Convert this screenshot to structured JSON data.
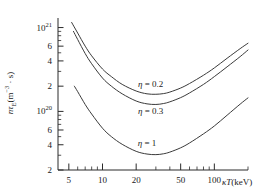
{
  "chart_data": {
    "type": "line",
    "title": "",
    "subtitle": "",
    "xlabel": "κT(keV)",
    "ylabel": "nτE(m⁻³ · s)",
    "xscale": "log",
    "yscale": "log",
    "xlim": [
      4,
      200
    ],
    "ylim": [
      2e+19,
      1.3e+21
    ],
    "grid": false,
    "legend_position": "inline-annotations",
    "xticks_major": [
      5,
      10,
      20,
      50,
      100
    ],
    "xtick_labels": [
      "5",
      "10",
      "20",
      "50",
      "100"
    ],
    "xticks_minor": [
      6,
      7,
      8,
      9,
      30,
      40,
      60,
      70,
      80,
      90,
      200
    ],
    "ytick_labels": [
      {
        "value": 1e+21,
        "text": "10",
        "exponent": "21"
      },
      {
        "value": 6e+20,
        "text": "6",
        "exponent": ""
      },
      {
        "value": 4e+20,
        "text": "4",
        "exponent": ""
      },
      {
        "value": 2e+20,
        "text": "2",
        "exponent": ""
      },
      {
        "value": 1e+20,
        "text": "10",
        "exponent": "20"
      },
      {
        "value": 6e+19,
        "text": "6",
        "exponent": ""
      },
      {
        "value": 4e+19,
        "text": "4",
        "exponent": ""
      },
      {
        "value": 2e+19,
        "text": "2",
        "exponent": ""
      }
    ],
    "yticks_minor": [
      9e+20,
      8e+20,
      7e+20,
      5e+20,
      3e+20,
      9e+19,
      8e+19,
      7e+19,
      5e+19,
      3e+19
    ],
    "series": [
      {
        "name": "η = 0.2",
        "annotation": "η = 0.2",
        "annotation_x": 27,
        "annotation_y": 2.1e+20,
        "color": "#3a3a3a",
        "x": [
          5.3,
          6,
          7,
          8,
          10,
          12,
          15,
          20,
          25,
          30,
          35,
          40,
          50,
          60,
          80,
          100,
          130,
          170,
          200
        ],
        "y": [
          1.15e+21,
          8.6e+20,
          6e+20,
          4.6e+20,
          3.2e+20,
          2.6e+20,
          2.1e+20,
          1.75e+20,
          1.62e+20,
          1.6e+20,
          1.63e+20,
          1.7e+20,
          1.9e+20,
          2.15e+20,
          2.7e+20,
          3.3e+20,
          4.3e+20,
          5.6e+20,
          6.5e+20
        ]
      },
      {
        "name": "η = 0.3",
        "annotation": "η = 0.3",
        "annotation_x": 27,
        "annotation_y": 1e+20,
        "color": "#3a3a3a",
        "x": [
          5.5,
          6,
          7,
          8,
          10,
          12,
          15,
          20,
          25,
          30,
          35,
          40,
          50,
          60,
          80,
          100,
          130,
          170,
          200
        ],
        "y": [
          9e+20,
          7.2e+20,
          4.9e+20,
          3.7e+20,
          2.5e+20,
          2e+20,
          1.62e+20,
          1.33e+20,
          1.23e+20,
          1.21e+20,
          1.24e+20,
          1.3e+20,
          1.46e+20,
          1.66e+20,
          2.1e+20,
          2.6e+20,
          3.4e+20,
          4.5e+20,
          5.4e+20
        ]
      },
      {
        "name": "η = 1",
        "annotation": "η = 1",
        "annotation_x": 25,
        "annotation_y": 4.2e+19,
        "color": "#3a3a3a",
        "x": [
          5.6,
          6,
          7,
          8,
          10,
          12,
          15,
          20,
          25,
          30,
          35,
          40,
          50,
          60,
          80,
          100,
          130,
          170,
          200
        ],
        "y": [
          2e+20,
          1.72e+20,
          1.21e+20,
          9.3e+19,
          6.3e+19,
          5e+19,
          4.05e+19,
          3.34e+19,
          3.1e+19,
          3.05e+19,
          3.12e+19,
          3.27e+19,
          3.68e+19,
          4.2e+19,
          5.4e+19,
          6.7e+19,
          9e+19,
          1.22e+20,
          1.45e+20
        ]
      }
    ]
  },
  "axes": {
    "x_title": "κT(keV)",
    "x_title_kappa": "κ",
    "x_title_T": "T",
    "x_title_unit": "(keV)",
    "y_title": "nτE(m⁻³ · s)"
  }
}
